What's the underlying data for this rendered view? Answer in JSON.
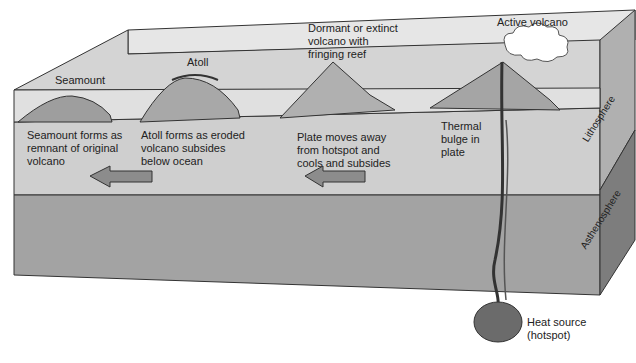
{
  "diagram": {
    "features": {
      "seamount": "Seamount",
      "atoll": "Atoll",
      "dormant_volcano": "Dormant or extinct\nvolcano with\nfringing reef",
      "active_volcano": "Active volcano"
    },
    "descriptions": {
      "seamount": "Seamount forms as\nremnant of original\nvolcano",
      "atoll": "Atoll forms as eroded\nvolcano subsides\nbelow ocean",
      "plate": "Plate moves away\nfrom hotspot and\ncools and subsides",
      "thermal": "Thermal\nbulge in\nplate"
    },
    "layers": {
      "lithosphere": "Lithosphere",
      "asthenosphere": "Asthenosphere"
    },
    "heat_source": "Heat source\n(hotspot)",
    "colors": {
      "ocean": "#d9d9d9",
      "lithosphere": "#c4c4c4",
      "asthenosphere": "#9a9a9a",
      "side": "#8a8a8a",
      "outline": "#333333"
    }
  }
}
